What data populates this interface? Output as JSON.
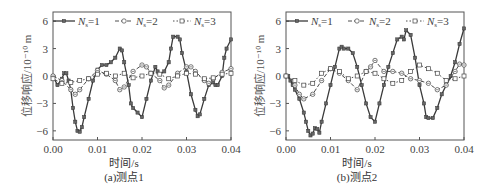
{
  "figure": {
    "panels": [
      {
        "id": "a",
        "caption": "(a)测点1",
        "xlabel": "时间/s",
        "ylabel": "位移响应/10⁻¹⁰ m"
      },
      {
        "id": "b",
        "caption": "(b)测点2",
        "xlabel": "时间/s",
        "ylabel": "位移响应/10⁻¹⁰ m"
      }
    ],
    "legend": [
      "Ns=1",
      "Ns=2",
      "Ns=3"
    ],
    "colors": {
      "axis": "#555555",
      "series": "#3a3a3a",
      "marker_fill_1": "#777777"
    }
  },
  "chart_data": [
    {
      "type": "line",
      "title": "(a)测点1",
      "xlabel": "时间/s",
      "ylabel": "位移响应/10⁻¹⁰ m",
      "xlim": [
        0.0,
        0.04
      ],
      "ylim": [
        -7,
        7
      ],
      "xticks": [
        "0.00",
        "0.01",
        "0.02",
        "0.03",
        "0.04"
      ],
      "yticks": [
        "-6",
        "-3",
        "0",
        "3",
        "6"
      ],
      "legend_position": "top",
      "grid": false,
      "series": [
        {
          "name": "Ns=1",
          "style": "solid, filled square markers",
          "x": [
            0,
            0.001,
            0.002,
            0.0025,
            0.003,
            0.0035,
            0.004,
            0.0045,
            0.005,
            0.0055,
            0.006,
            0.0065,
            0.007,
            0.008,
            0.009,
            0.01,
            0.011,
            0.012,
            0.013,
            0.014,
            0.015,
            0.0155,
            0.016,
            0.017,
            0.0175,
            0.018,
            0.019,
            0.02,
            0.021,
            0.022,
            0.023,
            0.0235,
            0.024,
            0.025,
            0.026,
            0.0265,
            0.027,
            0.028,
            0.0285,
            0.029,
            0.03,
            0.031,
            0.032,
            0.0325,
            0.033,
            0.034,
            0.035,
            0.036,
            0.0365,
            0.037,
            0.038,
            0.0385,
            0.039,
            0.04
          ],
          "y": [
            0,
            -1,
            -0.3,
            0.3,
            0.3,
            -0.5,
            -1.5,
            -3.5,
            -5,
            -6,
            -6.1,
            -5.6,
            -4.5,
            -2.5,
            -0.5,
            0.7,
            1.2,
            1.2,
            1.5,
            2,
            3,
            2.8,
            1.5,
            -1,
            -3,
            -3.5,
            -4,
            -4.5,
            -2.5,
            -0.5,
            1,
            0.5,
            0.2,
            0.5,
            1.5,
            3,
            4.3,
            4.3,
            4,
            2.5,
            0.5,
            -2,
            -3.7,
            -4.4,
            -4.2,
            -2.5,
            -1,
            -0.7,
            -1,
            -1,
            0,
            2,
            3,
            4
          ]
        },
        {
          "name": "Ns=2",
          "style": "dashed, circle-dot markers",
          "x": [
            0,
            0.002,
            0.004,
            0.005,
            0.006,
            0.008,
            0.01,
            0.012,
            0.014,
            0.015,
            0.016,
            0.018,
            0.02,
            0.021,
            0.022,
            0.024,
            0.025,
            0.026,
            0.028,
            0.03,
            0.031,
            0.032,
            0.034,
            0.035,
            0.036,
            0.038,
            0.04
          ],
          "y": [
            0,
            -0.5,
            -1.5,
            -2,
            -1.5,
            -0.3,
            0.6,
            0.2,
            -0.5,
            -1.5,
            -1.2,
            0.5,
            1.2,
            1,
            0.3,
            -0.5,
            -1.3,
            -1,
            0.3,
            1,
            1,
            0.5,
            -0.5,
            -0.8,
            -0.3,
            0.4,
            0.8
          ]
        },
        {
          "name": "Ns=3",
          "style": "dotted, open square markers",
          "x": [
            0,
            0.002,
            0.004,
            0.006,
            0.008,
            0.01,
            0.012,
            0.014,
            0.016,
            0.018,
            0.02,
            0.022,
            0.024,
            0.026,
            0.028,
            0.03,
            0.032,
            0.034,
            0.036,
            0.038,
            0.04
          ],
          "y": [
            -0.3,
            -0.8,
            -0.7,
            -0.5,
            -0.3,
            0.2,
            0.3,
            0,
            0.3,
            -0.2,
            0,
            0.3,
            0.2,
            -0.3,
            0,
            0.3,
            0.2,
            -0.3,
            -0.2,
            0.2,
            0.3
          ]
        }
      ]
    },
    {
      "type": "line",
      "title": "(b)测点2",
      "xlabel": "时间/s",
      "ylabel": "位移响应/10⁻¹⁰ m",
      "xlim": [
        0.0,
        0.04
      ],
      "ylim": [
        -7,
        7
      ],
      "xticks": [
        "0.00",
        "0.01",
        "0.02",
        "0.03",
        "0.04"
      ],
      "yticks": [
        "-6",
        "-3",
        "0",
        "3",
        "6"
      ],
      "legend_position": "top",
      "grid": false,
      "series": [
        {
          "name": "Ns=1",
          "style": "solid, filled square markers",
          "x": [
            0,
            0.0005,
            0.001,
            0.0015,
            0.002,
            0.003,
            0.004,
            0.0045,
            0.005,
            0.0055,
            0.006,
            0.0065,
            0.007,
            0.0075,
            0.008,
            0.009,
            0.01,
            0.011,
            0.012,
            0.0125,
            0.013,
            0.014,
            0.015,
            0.016,
            0.017,
            0.018,
            0.019,
            0.02,
            0.021,
            0.022,
            0.023,
            0.024,
            0.025,
            0.026,
            0.0265,
            0.027,
            0.028,
            0.029,
            0.03,
            0.031,
            0.0315,
            0.032,
            0.033,
            0.034,
            0.035,
            0.036,
            0.037,
            0.038,
            0.039,
            0.04
          ],
          "y": [
            0,
            0,
            -0.5,
            -1,
            -1.5,
            -2.5,
            -4,
            -5,
            -6,
            -6.5,
            -6.3,
            -5.7,
            -5.8,
            -6.2,
            -5,
            -3,
            -1,
            1,
            3,
            3.2,
            3,
            3,
            2.5,
            1,
            -1,
            -3,
            -4.5,
            -5,
            -3,
            -1,
            1,
            2.5,
            4,
            4.3,
            4,
            5,
            4.5,
            2,
            -1,
            -3,
            -4.5,
            -4.6,
            -4.6,
            -3.5,
            -2,
            -1,
            0,
            1.5,
            3.5,
            5.2
          ]
        },
        {
          "name": "Ns=2",
          "style": "dashed, circle-dot markers",
          "x": [
            0,
            0.002,
            0.003,
            0.004,
            0.006,
            0.008,
            0.01,
            0.012,
            0.014,
            0.016,
            0.018,
            0.019,
            0.02,
            0.022,
            0.024,
            0.026,
            0.028,
            0.03,
            0.032,
            0.034,
            0.036,
            0.038,
            0.039,
            0.04
          ],
          "y": [
            0,
            -1,
            -2,
            -2.5,
            -2,
            -0.5,
            0.8,
            0.3,
            -0.5,
            -1.5,
            0.5,
            1,
            1.7,
            0.5,
            0.5,
            0.3,
            -0.3,
            -0.5,
            -0.8,
            -1.5,
            -1,
            0.5,
            1.3,
            1.2
          ]
        },
        {
          "name": "Ns=3",
          "style": "dotted, open square markers",
          "x": [
            0,
            0.002,
            0.004,
            0.006,
            0.008,
            0.01,
            0.012,
            0.014,
            0.016,
            0.018,
            0.02,
            0.022,
            0.024,
            0.026,
            0.028,
            0.03,
            0.032,
            0.034,
            0.036,
            0.038,
            0.04
          ],
          "y": [
            0,
            -0.5,
            -1,
            -0.8,
            0.3,
            0.8,
            0.5,
            -0.3,
            0,
            0.5,
            0.3,
            -0.3,
            -0.8,
            -0.5,
            0.5,
            1.2,
            0.8,
            0.3,
            -0.5,
            -0.3,
            0
          ]
        }
      ]
    }
  ]
}
